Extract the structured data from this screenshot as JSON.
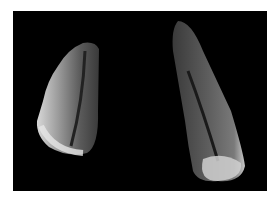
{
  "image": {
    "description": "Two elongated tooth specimens photographed against a black background",
    "background_color": "#000000",
    "frame_color": "#ffffff",
    "specimens": [
      {
        "name": "left-tooth",
        "color": "#8a8a8a"
      },
      {
        "name": "right-tooth",
        "color": "#6e6e6e"
      }
    ]
  }
}
